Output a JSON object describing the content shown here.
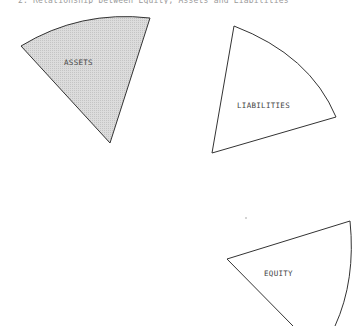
{
  "caption": "2.  Relationship between Equity, Assets and Liabilities",
  "diagram": {
    "sectors": [
      {
        "id": "assets",
        "label": "ASSETS",
        "fill": "#d6d6d6",
        "shaded": true
      },
      {
        "id": "liabilities",
        "label": "LIABILITIES",
        "fill": "#ffffff",
        "shaded": false
      },
      {
        "id": "equity",
        "label": "EQUITY",
        "fill": "#ffffff",
        "shaded": false
      }
    ],
    "stroke_color": "#333333"
  }
}
